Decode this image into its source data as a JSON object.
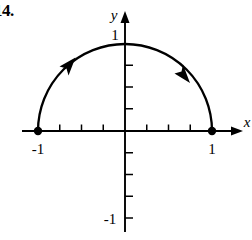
{
  "figure": {
    "problem_number": "14.",
    "axes": {
      "x_axis_label": "x",
      "y_axis_label": "y",
      "origin": {
        "x": 125,
        "y": 131
      },
      "unit_px": 87,
      "tick_step_units": 0.25,
      "x_tick_labels": [
        {
          "text": "-1",
          "value": -1
        },
        {
          "text": "1",
          "value": 1
        }
      ],
      "y_tick_labels": [
        {
          "text": "1",
          "value": 1
        },
        {
          "text": "-1",
          "value": -1
        }
      ],
      "x_ticks_left_of_origin": 3,
      "x_ticks_right_of_origin": 3,
      "y_ticks_above_origin": 3,
      "y_ticks_below_origin": 4
    },
    "curve": {
      "description": "upper unit semicircle",
      "center": {
        "x": 0,
        "y": 0
      },
      "radius": 1,
      "start_point": {
        "x": -1,
        "y": 0
      },
      "end_point": {
        "x": 1,
        "y": 0
      },
      "apex_point": {
        "x": 0,
        "y": 1
      },
      "orientation": "clockwise",
      "direction_arrows": 2,
      "endpoints_filled": true
    },
    "colors": {
      "ink": "#000000",
      "background": "#ffffff"
    }
  }
}
